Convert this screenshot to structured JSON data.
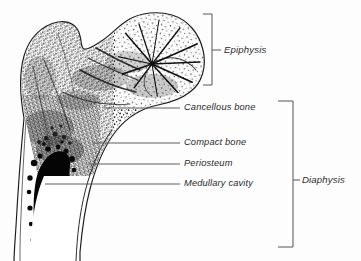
{
  "figure": {
    "kind": "anatomical-illustration",
    "orientation": "coronal cut-away",
    "style": "black-and-white stippled line drawing",
    "background_color": "#fdfdfd",
    "ink_color": "#1a1a1a",
    "leader_color": "#555555",
    "bracket_color": "#555555"
  },
  "callouts": [
    {
      "id": "cancellous-bone",
      "label": "Cancellous bone",
      "leader_from_x": 104,
      "leader_from_y": 108,
      "leader_to_x": 180,
      "leader_to_y": 108,
      "text_x": 184,
      "text_y": 103
    },
    {
      "id": "compact-bone",
      "label": "Compact bone",
      "leader_from_x": 92,
      "leader_from_y": 143,
      "leader_to_x": 180,
      "leader_to_y": 143,
      "text_x": 184,
      "text_y": 138
    },
    {
      "id": "periosteum",
      "label": "Periosteum",
      "leader_from_x": 88,
      "leader_from_y": 164,
      "leader_to_x": 180,
      "leader_to_y": 164,
      "text_x": 184,
      "text_y": 159
    },
    {
      "id": "medullary-cavity",
      "label": "Medullary cavity",
      "leader_from_x": 45,
      "leader_from_y": 184,
      "leader_to_x": 180,
      "leader_to_y": 184,
      "text_x": 184,
      "text_y": 179
    }
  ],
  "brackets": [
    {
      "id": "epiphysis",
      "label": "Epiphysis",
      "spine_x": 212,
      "top_y": 14,
      "bottom_y": 85,
      "tick_x": 203,
      "leader_x": 221,
      "leader_y": 50,
      "text_x": 224,
      "text_y": 45
    },
    {
      "id": "diaphysis",
      "label": "Diaphysis",
      "spine_x": 293,
      "top_y": 101,
      "bottom_y": 247,
      "tick_x": 278,
      "leader_x": 300,
      "leader_y": 180,
      "text_x": 302,
      "text_y": 175
    }
  ],
  "regions": [
    {
      "id": "greater-trochanter",
      "name": "Greater trochanter"
    },
    {
      "id": "femoral-head",
      "name": "Head of femur"
    },
    {
      "id": "femoral-neck",
      "name": "Neck of femur"
    },
    {
      "id": "trabecular-texture",
      "name": "Trabecular (spongy) bone texture"
    },
    {
      "id": "medullary-cavity-fill",
      "name": "Medullary cavity (marrow)"
    },
    {
      "id": "compact-bone-wall",
      "name": "Compact bone cortex"
    },
    {
      "id": "periosteum-line",
      "name": "Periosteum outer membrane"
    }
  ]
}
